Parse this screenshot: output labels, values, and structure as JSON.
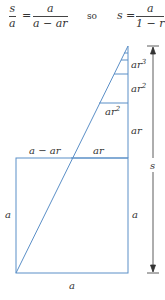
{
  "equation": {
    "lhs_num": "s",
    "lhs_den": "a",
    "eq1": "=",
    "mid_num": "a",
    "mid_den": "a − ar",
    "conj": "so",
    "rhs_var": "s",
    "eq2": "=",
    "rhs_num": "a",
    "rhs_den": "1 − r"
  },
  "diagram": {
    "line_color": "#5b8fc7",
    "text_color": "#333333",
    "labels": {
      "ar3": "ar",
      "ar3_exp": "3",
      "ar2_right": "ar",
      "ar2_right_exp": "2",
      "ar2_left": "ar",
      "ar2_left_exp": "2",
      "ar_right": "ar",
      "ar_top": "ar",
      "a_minus_ar": "a − ar",
      "a_left": "a",
      "a_right": "a",
      "a_bottom": "a",
      "s_arrow": "s"
    }
  }
}
